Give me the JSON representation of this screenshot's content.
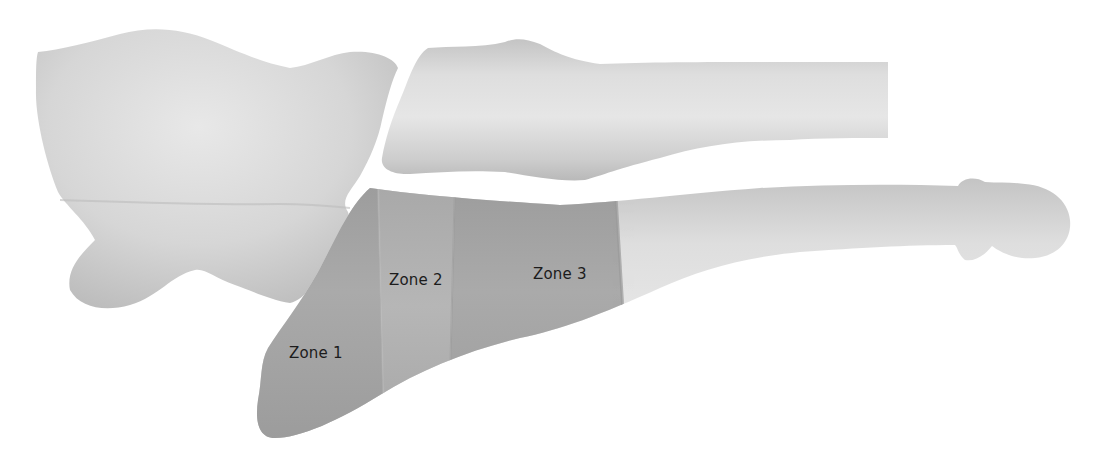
{
  "diagram": {
    "type": "anatomical-illustration",
    "zones": [
      {
        "id": "zone-1",
        "label": "Zone 1",
        "x": 289,
        "y": 350,
        "fill": "#a2a2a2"
      },
      {
        "id": "zone-2",
        "label": "Zone 2",
        "x": 389,
        "y": 275,
        "fill": "#b0b0b0"
      },
      {
        "id": "zone-3",
        "label": "Zone 3",
        "x": 533,
        "y": 267,
        "fill": "#a4a4a4"
      }
    ],
    "bones": [
      {
        "id": "cuboid",
        "fill": "#d6d6d6"
      },
      {
        "id": "fourth-metatarsal",
        "fill": "#d8d8d8"
      },
      {
        "id": "fifth-metatarsal",
        "fill": "#d8d8d8"
      }
    ],
    "colors": {
      "background": "#ffffff",
      "bone_light": "#e4e4e4",
      "bone_mid": "#cfcfcf",
      "bone_shadow": "#b8b8b8",
      "zone_shade": "#a6a6a6",
      "label_text": "#1c1c1c"
    }
  }
}
